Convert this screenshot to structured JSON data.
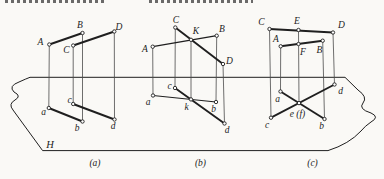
{
  "canvas": {
    "width": 384,
    "height": 179,
    "background": "#faf9f6",
    "stroke_color": "#1f1f1f",
    "thin_stroke_color": "#4a4a4a"
  },
  "top_fragments": [
    {
      "x": 5,
      "width": 99
    },
    {
      "x": 149,
      "width": 104
    }
  ],
  "plane": {
    "label": "H",
    "label_x": 50,
    "label_y": 144,
    "outline": "M 30 77.3 L 345 77.3 L 358 90 Q 368 97 363 103 Q 358 109 371 113 Q 380 117 371 122 Q 365 126 361 131 Q 349 144 328 150.6 L 42.6 150.6 L 13 110 Q 8 104 15 100 Q 22 96 14 92 Q 8 86 19 82 Q 26 78.8 30 77.3 Z"
  },
  "figures": [
    {
      "id": "a",
      "caption": "(a)",
      "caption_x": 95,
      "caption_y": 163,
      "points": {
        "A": [
          49.3,
          44.5
        ],
        "B": [
          82.5,
          33
        ],
        "C": [
          73.2,
          45.5
        ],
        "D": [
          114.3,
          31.5
        ],
        "a": [
          48.8,
          108
        ],
        "b": [
          82.5,
          121.5
        ],
        "c": [
          73.2,
          104
        ],
        "d": [
          114.5,
          119.5
        ]
      },
      "thick_segments": [
        [
          "A",
          "B"
        ],
        [
          "C",
          "D"
        ],
        [
          "a",
          "b"
        ],
        [
          "c",
          "d"
        ]
      ],
      "thin_segments": [
        [
          "A",
          "a"
        ],
        [
          "B",
          "b"
        ],
        [
          "C",
          "c"
        ],
        [
          "D",
          "d"
        ]
      ],
      "labels": [
        {
          "text": "A",
          "x": 40.5,
          "y": 42
        },
        {
          "text": "B",
          "x": 80,
          "y": 24.5
        },
        {
          "text": "C",
          "x": 66.5,
          "y": 50
        },
        {
          "text": "D",
          "x": 119,
          "y": 27
        },
        {
          "text": "a",
          "x": 43.5,
          "y": 111.5
        },
        {
          "text": "b",
          "x": 77,
          "y": 127.5
        },
        {
          "text": "c",
          "x": 69.5,
          "y": 99.5
        },
        {
          "text": "d",
          "x": 113,
          "y": 125.5
        }
      ]
    },
    {
      "id": "b",
      "caption": "(b)",
      "caption_x": 200.5,
      "caption_y": 163,
      "points": {
        "A": [
          152.7,
          46.7
        ],
        "B": [
          216.7,
          35.7
        ],
        "C": [
          175.3,
          27.5
        ],
        "D": [
          223,
          64
        ],
        "K": [
          191,
          39.8
        ],
        "a": [
          153,
          95.5
        ],
        "b": [
          216,
          102
        ],
        "c": [
          175,
          88
        ],
        "k": [
          191,
          99.4
        ],
        "d": [
          224.5,
          123.5
        ]
      },
      "thick_segments": [
        [
          "C",
          "D"
        ],
        [
          "c",
          "d"
        ]
      ],
      "medium_segments": [
        [
          "A",
          "B"
        ],
        [
          "a",
          "b"
        ]
      ],
      "thin_segments": [
        [
          "A",
          "a"
        ],
        [
          "B",
          "b"
        ],
        [
          "C",
          "c"
        ],
        [
          "K",
          "k"
        ],
        [
          "D",
          "d"
        ]
      ],
      "labels": [
        {
          "text": "A",
          "x": 145,
          "y": 49
        },
        {
          "text": "B",
          "x": 222,
          "y": 28.5
        },
        {
          "text": "C",
          "x": 176,
          "y": 20
        },
        {
          "text": "D",
          "x": 229.5,
          "y": 60.5
        },
        {
          "text": "K",
          "x": 196,
          "y": 31
        },
        {
          "text": "a",
          "x": 148,
          "y": 102
        },
        {
          "text": "b",
          "x": 213.5,
          "y": 108.5
        },
        {
          "text": "c",
          "x": 169.5,
          "y": 85.5
        },
        {
          "text": "k",
          "x": 186.5,
          "y": 107
        },
        {
          "text": "d",
          "x": 227,
          "y": 129.5
        }
      ]
    },
    {
      "id": "c",
      "caption": "(c)",
      "caption_x": 312.5,
      "caption_y": 163,
      "points": {
        "C": [
          269.5,
          29
        ],
        "E": [
          298.5,
          30
        ],
        "D": [
          333,
          32.5
        ],
        "A": [
          280.7,
          46.3
        ],
        "F": [
          298.5,
          44
        ],
        "B": [
          322.7,
          40.7
        ],
        "a": [
          280.5,
          91.5
        ],
        "d": [
          334.5,
          84.5
        ],
        "c": [
          271,
          117.7
        ],
        "b": [
          324.5,
          119
        ],
        "ef": [
          299,
          103.1
        ]
      },
      "thick_segments": [
        [
          "C",
          "D"
        ],
        [
          "A",
          "B"
        ],
        [
          "c",
          "d"
        ],
        [
          "a",
          "b"
        ]
      ],
      "thin_segments": [
        [
          "C",
          "c"
        ],
        [
          "A",
          "a"
        ],
        [
          "E",
          "ef"
        ],
        [
          "B",
          "b"
        ],
        [
          "D",
          "d"
        ]
      ],
      "labels": [
        {
          "text": "C",
          "x": 261.5,
          "y": 22
        },
        {
          "text": "E",
          "x": 297,
          "y": 21
        },
        {
          "text": "D",
          "x": 341.5,
          "y": 24.5
        },
        {
          "text": "A",
          "x": 276,
          "y": 38.5
        },
        {
          "text": "B",
          "x": 319.5,
          "y": 50
        },
        {
          "text": "F",
          "x": 303,
          "y": 51.5
        },
        {
          "text": "a",
          "x": 277.5,
          "y": 98.5
        },
        {
          "text": "d",
          "x": 340.5,
          "y": 90.5
        },
        {
          "text": "c",
          "x": 267,
          "y": 124.5
        },
        {
          "text": "b",
          "x": 321.5,
          "y": 126
        },
        {
          "text": "e (f)",
          "x": 297.5,
          "y": 113.5
        }
      ]
    }
  ]
}
